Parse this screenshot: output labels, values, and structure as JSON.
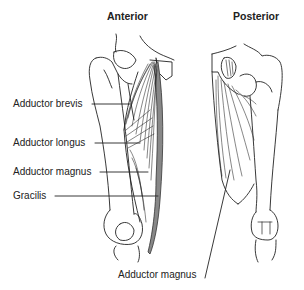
{
  "views": {
    "anterior": {
      "title": "Anterior"
    },
    "posterior": {
      "title": "Posterior"
    }
  },
  "labels": {
    "adductor_brevis": "Adductor brevis",
    "adductor_longus": "Adductor longus",
    "adductor_magnus": "Adductor magnus",
    "gracilis": "Gracilis",
    "posterior_adductor_magnus": "Adductor magnus"
  },
  "colors": {
    "line": "#222222",
    "text": "#222222",
    "gracilis_fill": "#888888"
  }
}
